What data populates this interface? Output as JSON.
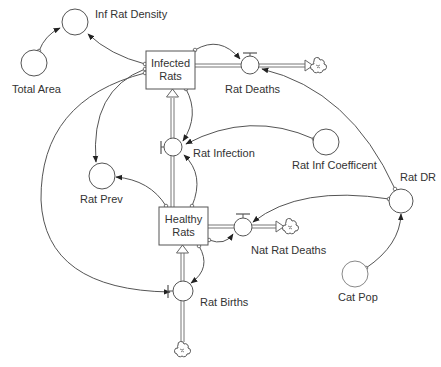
{
  "diagram": {
    "type": "stock-and-flow",
    "stocks": [
      {
        "id": "infected_rats",
        "line1": "Infected",
        "line2": "Rats"
      },
      {
        "id": "healthy_rats",
        "line1": "Healthy",
        "line2": "Rats"
      }
    ],
    "flows": [
      {
        "id": "rat_deaths",
        "label": "Rat Deaths",
        "from": "Infected Rats",
        "to": "cloud"
      },
      {
        "id": "rat_infection",
        "label": "Rat Infection",
        "from": "Healthy Rats",
        "to": "Infected Rats"
      },
      {
        "id": "nat_rat_deaths",
        "label": "Nat Rat Deaths",
        "from": "Healthy Rats",
        "to": "cloud"
      },
      {
        "id": "rat_births",
        "label": "Rat Births",
        "from": "cloud",
        "to": "Healthy Rats"
      }
    ],
    "converters": [
      {
        "id": "inf_rat_density",
        "label": "Inf Rat Density"
      },
      {
        "id": "total_area",
        "label": "Total Area"
      },
      {
        "id": "rat_inf_coefficent",
        "label": "Rat Inf Coefficent"
      },
      {
        "id": "rat_dr",
        "label": "Rat DR"
      },
      {
        "id": "rat_prev",
        "label": "Rat Prev"
      },
      {
        "id": "cat_pop",
        "label": "Cat Pop"
      }
    ],
    "connectors": [
      {
        "from": "Total Area",
        "to": "Inf Rat Density"
      },
      {
        "from": "Infected Rats",
        "to": "Inf Rat Density"
      },
      {
        "from": "Infected Rats",
        "to": "Rat Deaths"
      },
      {
        "from": "Infected Rats",
        "to": "Rat Infection"
      },
      {
        "from": "Infected Rats",
        "to": "Rat Prev"
      },
      {
        "from": "Infected Rats",
        "to": "Rat Births"
      },
      {
        "from": "Rat Inf Coefficent",
        "to": "Rat Infection"
      },
      {
        "from": "Healthy Rats",
        "to": "Rat Infection"
      },
      {
        "from": "Healthy Rats",
        "to": "Rat Prev"
      },
      {
        "from": "Healthy Rats",
        "to": "Nat Rat Deaths"
      },
      {
        "from": "Healthy Rats",
        "to": "Rat Births"
      },
      {
        "from": "Rat DR",
        "to": "Rat Deaths"
      },
      {
        "from": "Rat DR",
        "to": "Nat Rat Deaths"
      },
      {
        "from": "Cat Pop",
        "to": "Rat DR"
      }
    ]
  },
  "labels": {
    "inf_rat_density": "Inf Rat Density",
    "total_area": "Total Area",
    "infected_rats_1": "Infected",
    "infected_rats_2": "Rats",
    "rat_deaths": "Rat Deaths",
    "rat_infection": "Rat Infection",
    "rat_inf_coefficent": "Rat Inf Coefficent",
    "rat_dr": "Rat DR",
    "rat_prev": "Rat Prev",
    "healthy_rats_1": "Healthy",
    "healthy_rats_2": "Rats",
    "nat_rat_deaths": "Nat Rat Deaths",
    "rat_births": "Rat Births",
    "cat_pop": "Cat Pop"
  },
  "colors": {
    "stroke": "#555555",
    "text": "#333333",
    "background": "#ffffff"
  }
}
